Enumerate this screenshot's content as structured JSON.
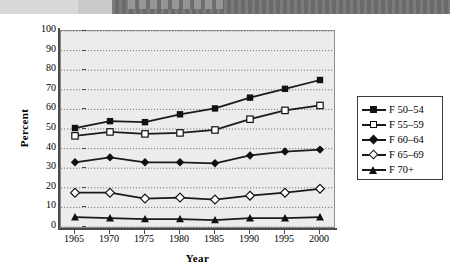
{
  "banner": {
    "present": true,
    "text": ""
  },
  "chart_data": {
    "type": "line",
    "title": "",
    "xlabel": "Year",
    "ylabel": "Percent",
    "x": [
      1965,
      1970,
      1975,
      1980,
      1985,
      1990,
      1995,
      2000
    ],
    "xtick_labels": [
      "1965",
      "1970",
      "1975",
      "1980",
      "1985",
      "1990",
      "1995",
      "2000"
    ],
    "ytick_labels": [
      "0",
      "10",
      "20",
      "30",
      "40",
      "50",
      "60",
      "70",
      "80",
      "90",
      "100"
    ],
    "yticks": [
      0,
      10,
      20,
      30,
      40,
      50,
      60,
      70,
      80,
      90,
      100
    ],
    "ylim": [
      0,
      100
    ],
    "xlim": [
      1963,
      2002
    ],
    "grid": true,
    "grid_style": "dotted",
    "legend_position": "right",
    "plot_background": "#ececec",
    "line_color": "#1a1a1a",
    "series": [
      {
        "name": "F 50–54",
        "marker": "filled-square",
        "values": [
          50.5,
          54.0,
          53.5,
          57.5,
          60.5,
          66.0,
          70.5,
          75.0
        ]
      },
      {
        "name": "F 55–59",
        "marker": "open-square",
        "values": [
          46.5,
          48.5,
          47.5,
          48.0,
          49.5,
          55.0,
          59.5,
          62.0
        ]
      },
      {
        "name": "F 60–64",
        "marker": "filled-diamond",
        "values": [
          33.0,
          35.5,
          33.0,
          33.0,
          32.5,
          36.5,
          38.5,
          39.5
        ]
      },
      {
        "name": "F 65–69",
        "marker": "open-diamond",
        "values": [
          17.5,
          17.5,
          14.5,
          15.0,
          14.0,
          16.0,
          17.5,
          19.5
        ]
      },
      {
        "name": "F 70+",
        "marker": "filled-triangle",
        "values": [
          5.0,
          4.5,
          4.0,
          4.0,
          3.5,
          4.5,
          4.5,
          5.0
        ]
      }
    ]
  }
}
